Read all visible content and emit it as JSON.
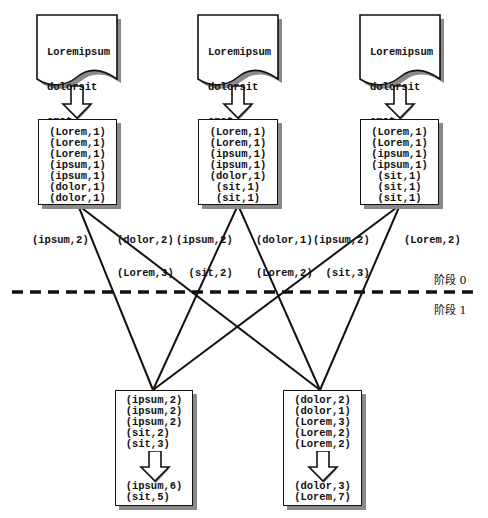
{
  "documents": [
    {
      "lines": [
        "Loremipsum",
        "dolorsit",
        "amet ..."
      ]
    },
    {
      "lines": [
        "Loremipsum",
        "dolorsit",
        "amet ..."
      ]
    },
    {
      "lines": [
        "Loremipsum",
        "dolorsit",
        "amet ..."
      ]
    }
  ],
  "map_boxes": [
    {
      "pairs": [
        "(Lorem,1)",
        "(Lorem,1)",
        "(Lorem,1)",
        "(ipsum,1)",
        "(ipsum,1)",
        "(dolor,1)",
        "(dolor,1)"
      ]
    },
    {
      "pairs": [
        "(Lorem,1)",
        "(Lorem,1)",
        "(ipsum,1)",
        "(ipsum,1)",
        "(dolor,1)",
        "(sit,1)",
        "(sit,1)"
      ]
    },
    {
      "pairs": [
        "(Lorem,1)",
        "(Lorem,1)",
        "(ipsum,1)",
        "(ipsum,1)",
        "(sit,1)",
        "(sit,1)",
        "(sit,1)"
      ]
    }
  ],
  "edge_labels": [
    {
      "id": "m0-to-r0",
      "lines": [
        "(ipsum,2)"
      ]
    },
    {
      "id": "m0-to-r1",
      "lines": [
        "(dolor,2)",
        "(Lorem,3)"
      ]
    },
    {
      "id": "m1-to-r0",
      "lines": [
        "(ipsum,2)",
        "  (sit,2)"
      ]
    },
    {
      "id": "m1-to-r1",
      "lines": [
        "(dolor,1)",
        "(Lorem,2)"
      ]
    },
    {
      "id": "m2-to-r0",
      "lines": [
        "(ipsum,2)",
        "  (sit,3)"
      ]
    },
    {
      "id": "m2-to-r1",
      "lines": [
        "(Lorem,2)"
      ]
    }
  ],
  "phases": {
    "top": "阶段 0",
    "bottom": "阶段 1"
  },
  "reduce_boxes": [
    {
      "inputs": [
        "(ipsum,2)",
        "(ipsum,2)",
        "(ipsum,2)",
        "(sit,2)  ",
        "(sit,3)  "
      ],
      "outputs": [
        "(ipsum,6)",
        "(sit,5)  "
      ]
    },
    {
      "inputs": [
        "(dolor,2)",
        "(dolor,1)",
        "(Lorem,3)",
        "(Lorem,2)",
        "(Lorem,2)"
      ],
      "outputs": [
        "(dolor,3)",
        "(Lorem,7)"
      ]
    }
  ],
  "colors": {
    "stroke": "#111111",
    "shadow": "#8a8a8a",
    "background": "#ffffff"
  }
}
